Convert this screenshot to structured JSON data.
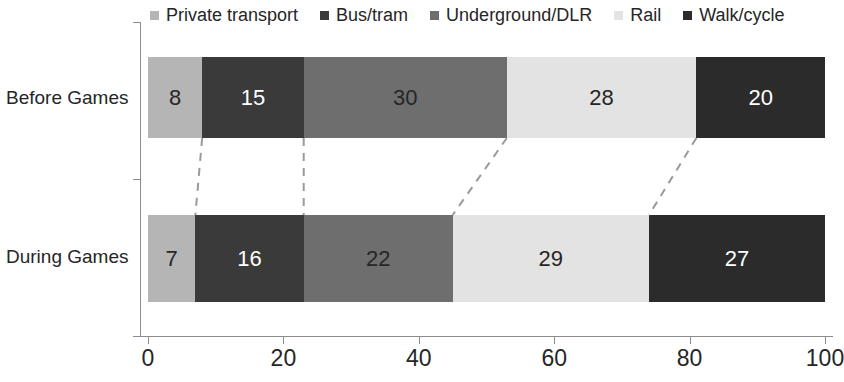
{
  "chart_data": {
    "type": "bar",
    "orientation": "horizontal",
    "stacked": true,
    "title": "",
    "subtitle": "",
    "xlabel": "",
    "ylabel": "",
    "xlim": [
      0,
      100
    ],
    "xticks": [
      "0",
      "20",
      "40",
      "60",
      "80",
      "100"
    ],
    "xtick_values": [
      0,
      20,
      40,
      60,
      80,
      100
    ],
    "grid": false,
    "legend_position": "top",
    "categories": [
      "Before Games",
      "During Games"
    ],
    "series": [
      {
        "name": "Private transport",
        "values": [
          8,
          15
        ],
        "color": "#b5b5b5",
        "label_color": "#262626"
      },
      {
        "name": "Bus/tram",
        "values": [
          15,
          16
        ],
        "color": "#3a3a3a",
        "label_color": "#ffffff"
      },
      {
        "name": "Underground/DLR",
        "values": [
          30,
          22
        ],
        "color": "#6e6e6e",
        "label_color": "#262626"
      },
      {
        "name": "Rail",
        "values": [
          28,
          29
        ],
        "color": "#e3e3e3",
        "label_color": "#262626"
      },
      {
        "name": "Walk/cycle",
        "values": [
          20,
          27
        ],
        "color": "#2b2b2b",
        "label_color": "#ffffff"
      }
    ],
    "bars": [
      {
        "category": "Before Games",
        "segments": [
          {
            "series": "Private transport",
            "value": 8,
            "start": 0,
            "end": 8
          },
          {
            "series": "Bus/tram",
            "value": 15,
            "start": 8,
            "end": 23
          },
          {
            "series": "Underground/DLR",
            "value": 30,
            "start": 23,
            "end": 53
          },
          {
            "series": "Rail",
            "value": 28,
            "start": 53,
            "end": 81
          },
          {
            "series": "Walk/cycle",
            "value": 20,
            "start": 81,
            "end": 101
          }
        ]
      },
      {
        "category": "During Games",
        "segments": [
          {
            "series": "Private transport",
            "value": 7,
            "start": 0,
            "end": 7
          },
          {
            "series": "Bus/tram",
            "value": 16,
            "start": 7,
            "end": 23
          },
          {
            "series": "Underground/DLR",
            "value": 22,
            "start": 23,
            "end": 45
          },
          {
            "series": "Rail",
            "value": 29,
            "start": 45,
            "end": 74
          },
          {
            "series": "Walk/cycle",
            "value": 27,
            "start": 74,
            "end": 101
          }
        ]
      }
    ],
    "connectors": [
      {
        "top_x": 8,
        "bottom_x": 7
      },
      {
        "top_x": 23,
        "bottom_x": 23
      },
      {
        "top_x": 53,
        "bottom_x": 45
      },
      {
        "top_x": 81,
        "bottom_x": 74
      }
    ],
    "connector_color": "#9a9a9a",
    "axis_color": "#8c8c8c",
    "background": "#ffffff"
  }
}
